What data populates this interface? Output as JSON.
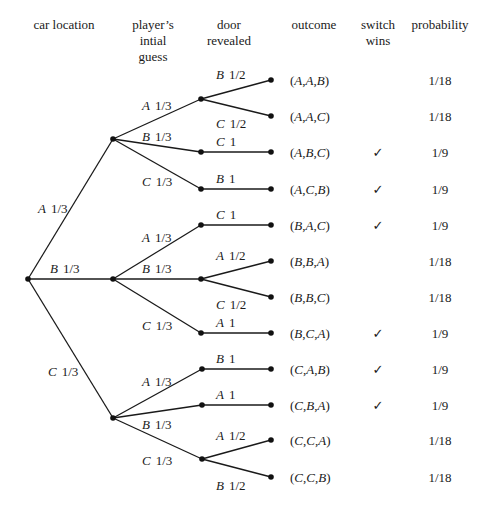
{
  "headers": [
    {
      "lines": [
        "car location"
      ],
      "x": 64,
      "y": 29
    },
    {
      "lines": [
        "player’s",
        "intial",
        "guess"
      ],
      "x": 153,
      "y": 29
    },
    {
      "lines": [
        "door",
        "revealed"
      ],
      "x": 229,
      "y": 29
    },
    {
      "lines": [
        "outcome"
      ],
      "x": 314,
      "y": 29
    },
    {
      "lines": [
        "switch",
        "wins"
      ],
      "x": 378,
      "y": 29
    },
    {
      "lines": [
        "probability"
      ],
      "x": 440,
      "y": 29
    }
  ],
  "root": {
    "x": 28,
    "y": 279
  },
  "level1": [
    {
      "door": "A",
      "prob": "1/3",
      "x": 113,
      "y": 139,
      "label_x": 38,
      "label_y": 213
    },
    {
      "door": "B",
      "prob": "1/3",
      "x": 113,
      "y": 279,
      "label_x": 50,
      "label_y": 273
    },
    {
      "door": "C",
      "prob": "1/3",
      "x": 113,
      "y": 418,
      "label_x": 48,
      "label_y": 376
    }
  ],
  "level2": [
    {
      "parent": 0,
      "door": "A",
      "prob": "1/3",
      "x": 201,
      "y": 99,
      "label_x": 142,
      "label_y": 110
    },
    {
      "parent": 0,
      "door": "B",
      "prob": "1/3",
      "x": 201,
      "y": 152,
      "label_x": 142,
      "label_y": 141
    },
    {
      "parent": 0,
      "door": "C",
      "prob": "1/3",
      "x": 201,
      "y": 189,
      "label_x": 142,
      "label_y": 186
    },
    {
      "parent": 1,
      "door": "A",
      "prob": "1/3",
      "x": 201,
      "y": 225,
      "label_x": 142,
      "label_y": 242
    },
    {
      "parent": 1,
      "door": "B",
      "prob": "1/3",
      "x": 201,
      "y": 279,
      "label_x": 142,
      "label_y": 273
    },
    {
      "parent": 1,
      "door": "C",
      "prob": "1/3",
      "x": 201,
      "y": 333,
      "label_x": 142,
      "label_y": 330
    },
    {
      "parent": 2,
      "door": "A",
      "prob": "1/3",
      "x": 202,
      "y": 369,
      "label_x": 142,
      "label_y": 386
    },
    {
      "parent": 2,
      "door": "B",
      "prob": "1/3",
      "x": 202,
      "y": 405,
      "label_x": 142,
      "label_y": 429
    },
    {
      "parent": 2,
      "door": "C",
      "prob": "1/3",
      "x": 202,
      "y": 459,
      "label_x": 142,
      "label_y": 465
    }
  ],
  "leaves": [
    {
      "parent": 0,
      "door": "B",
      "prob": "1/2",
      "x": 271,
      "y": 80,
      "label_x": 216,
      "label_y": 79,
      "outcome": [
        "A",
        "A",
        "B"
      ],
      "switch_wins": false,
      "probability": "1/18"
    },
    {
      "parent": 0,
      "door": "C",
      "prob": "1/2",
      "x": 271,
      "y": 116,
      "label_x": 216,
      "label_y": 128,
      "outcome": [
        "A",
        "A",
        "C"
      ],
      "switch_wins": false,
      "probability": "1/18"
    },
    {
      "parent": 1,
      "door": "C",
      "prob": "1",
      "x": 271,
      "y": 152,
      "label_x": 216,
      "label_y": 146,
      "outcome": [
        "A",
        "B",
        "C"
      ],
      "switch_wins": true,
      "probability": "1/9"
    },
    {
      "parent": 2,
      "door": "B",
      "prob": "1",
      "x": 271,
      "y": 189,
      "label_x": 216,
      "label_y": 183,
      "outcome": [
        "A",
        "C",
        "B"
      ],
      "switch_wins": true,
      "probability": "1/9"
    },
    {
      "parent": 3,
      "door": "C",
      "prob": "1",
      "x": 271,
      "y": 225,
      "label_x": 216,
      "label_y": 219,
      "outcome": [
        "B",
        "A",
        "C"
      ],
      "switch_wins": true,
      "probability": "1/9"
    },
    {
      "parent": 4,
      "door": "A",
      "prob": "1/2",
      "x": 271,
      "y": 261,
      "label_x": 216,
      "label_y": 260,
      "outcome": [
        "B",
        "B",
        "A"
      ],
      "switch_wins": false,
      "probability": "1/18"
    },
    {
      "parent": 4,
      "door": "C",
      "prob": "1/2",
      "x": 271,
      "y": 297,
      "label_x": 216,
      "label_y": 309,
      "outcome": [
        "B",
        "B",
        "C"
      ],
      "switch_wins": false,
      "probability": "1/18"
    },
    {
      "parent": 5,
      "door": "A",
      "prob": "1",
      "x": 271,
      "y": 333,
      "label_x": 216,
      "label_y": 327,
      "outcome": [
        "B",
        "C",
        "A"
      ],
      "switch_wins": true,
      "probability": "1/9"
    },
    {
      "parent": 6,
      "door": "B",
      "prob": "1",
      "x": 271,
      "y": 369,
      "label_x": 216,
      "label_y": 363,
      "outcome": [
        "C",
        "A",
        "B"
      ],
      "switch_wins": true,
      "probability": "1/9"
    },
    {
      "parent": 7,
      "door": "A",
      "prob": "1",
      "x": 271,
      "y": 405,
      "label_x": 216,
      "label_y": 399,
      "outcome": [
        "C",
        "B",
        "A"
      ],
      "switch_wins": true,
      "probability": "1/9"
    },
    {
      "parent": 8,
      "door": "A",
      "prob": "1/2",
      "x": 271,
      "y": 440,
      "label_x": 216,
      "label_y": 440,
      "outcome": [
        "C",
        "C",
        "A"
      ],
      "switch_wins": false,
      "probability": "1/18"
    },
    {
      "parent": 8,
      "door": "B",
      "prob": "1/2",
      "x": 271,
      "y": 477,
      "label_x": 216,
      "label_y": 490,
      "outcome": [
        "C",
        "C",
        "B"
      ],
      "switch_wins": false,
      "probability": "1/18"
    }
  ],
  "columns": {
    "outcome_x": 290,
    "switch_x": 378,
    "probability_x": 440
  },
  "check_glyph": "✓",
  "colors": {
    "ink": "#1a1a1a",
    "background": "#ffffff"
  }
}
